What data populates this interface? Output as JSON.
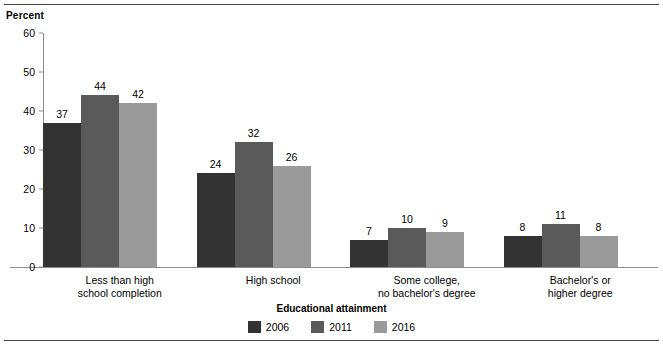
{
  "chart_data": {
    "type": "bar",
    "title": "",
    "subtitle": "",
    "xlabel": "Educational attainment",
    "ylabel": "Percent",
    "ylim": [
      0,
      60
    ],
    "yticks": [
      0,
      10,
      20,
      30,
      40,
      50,
      60
    ],
    "grid": false,
    "legend_position": "bottom",
    "categories": [
      "Less than high\nschool completion",
      "High school",
      "Some college,\nno bachelor's degree",
      "Bachelor's or\nhigher degree"
    ],
    "series": [
      {
        "name": "2006",
        "color": "#333333",
        "values": [
          37,
          24,
          7,
          8
        ]
      },
      {
        "name": "2011",
        "color": "#5a5a5a",
        "values": [
          44,
          32,
          10,
          11
        ]
      },
      {
        "name": "2016",
        "color": "#9a9a9a",
        "values": [
          42,
          26,
          9,
          8
        ]
      }
    ],
    "value_labels": [
      [
        "37",
        "44",
        "42"
      ],
      [
        "24",
        "32",
        "26"
      ],
      [
        "7",
        "10",
        "9"
      ],
      [
        "8",
        "11",
        "8"
      ]
    ],
    "ytick_labels": [
      "0",
      "10",
      "20",
      "30",
      "40",
      "50",
      "60"
    ]
  },
  "axis": {
    "unit_label": "Percent",
    "x_title": "Educational attainment"
  },
  "colors": {
    "axis_line": "#8c8c8c",
    "rule": "#444444",
    "background": "#ffffff",
    "series_2006": "#333333",
    "series_2011": "#5a5a5a",
    "series_2016": "#9a9a9a"
  }
}
